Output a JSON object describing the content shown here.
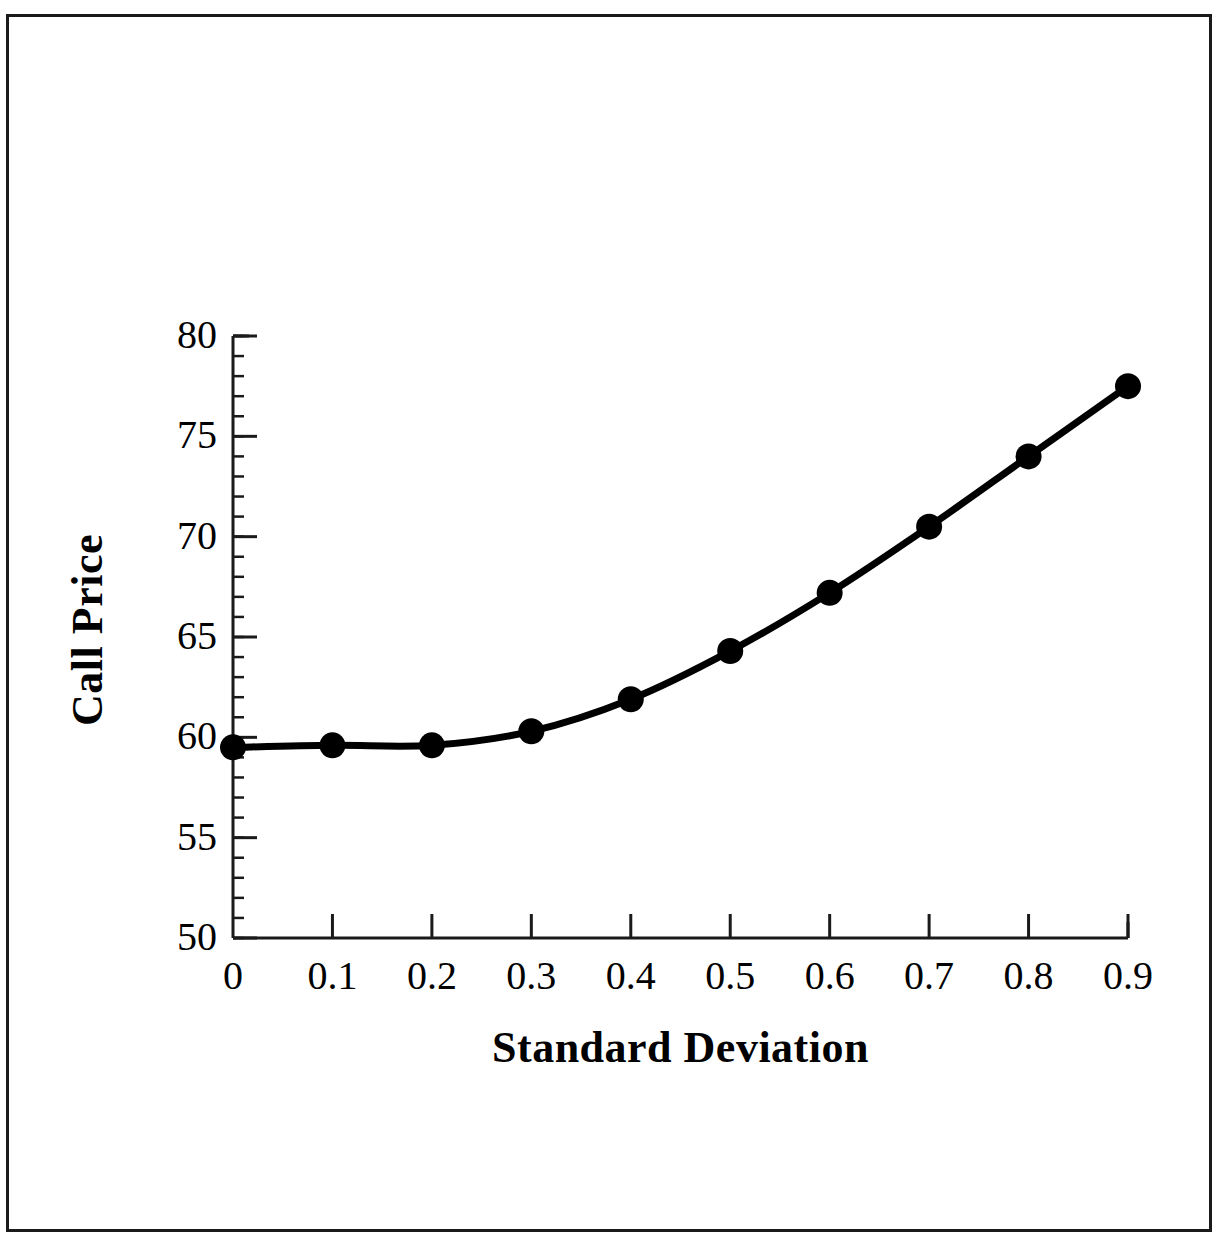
{
  "chart_data": {
    "type": "line",
    "title": "",
    "subtitle": "",
    "xlabel": "Standard Deviation",
    "ylabel": "Call Price",
    "x": [
      0,
      0.1,
      0.2,
      0.3,
      0.4,
      0.5,
      0.6,
      0.7,
      0.8,
      0.9
    ],
    "values": [
      59.5,
      59.6,
      59.6,
      60.3,
      61.9,
      64.3,
      67.2,
      70.5,
      74.0,
      77.5
    ],
    "series": [
      {
        "name": "Call Price",
        "values": [
          59.5,
          59.6,
          59.6,
          60.3,
          61.9,
          64.3,
          67.2,
          70.5,
          74.0,
          77.5
        ],
        "marker": "filled-circle",
        "color": "#000000",
        "line_width": 7
      }
    ],
    "xlim": [
      0,
      0.9
    ],
    "ylim": [
      50,
      80
    ],
    "xticks": [
      0,
      0.1,
      0.2,
      0.3,
      0.4,
      0.5,
      0.6,
      0.7,
      0.8,
      0.9
    ],
    "xtick_labels": [
      "0",
      "0.1",
      "0.2",
      "0.3",
      "0.4",
      "0.5",
      "0.6",
      "0.7",
      "0.8",
      "0.9"
    ],
    "yticks": [
      50,
      55,
      60,
      65,
      70,
      75,
      80
    ],
    "ytick_labels": [
      "50",
      "55",
      "60",
      "65",
      "70",
      "75",
      "80"
    ],
    "y_minor_tick_step": 1,
    "x_minor_ticks": false,
    "grid": false,
    "legend": null,
    "legend_position": "none",
    "annotations": [],
    "axis_color": "#1a1a1a",
    "background_color": "#ffffff",
    "frame": true,
    "tick_direction": "out"
  },
  "figure": {
    "frame_color": "#1a1a1a",
    "background_color": "#ffffff"
  }
}
